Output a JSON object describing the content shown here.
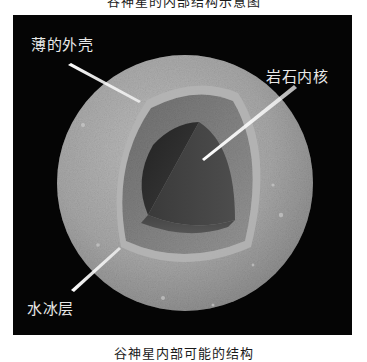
{
  "figure": {
    "top_caption": "谷神星的内部结构示意图",
    "bottom_caption": "谷神星内部可能的结构",
    "background_color": "#050505"
  },
  "sphere": {
    "surface_color": "#a8a8a8",
    "ice_layer_color": "#8c8c8c",
    "core_color": "#3a3a3a"
  },
  "labels": {
    "shell": "薄的外壳",
    "core": "岩石内核",
    "ice": "水冰层"
  }
}
